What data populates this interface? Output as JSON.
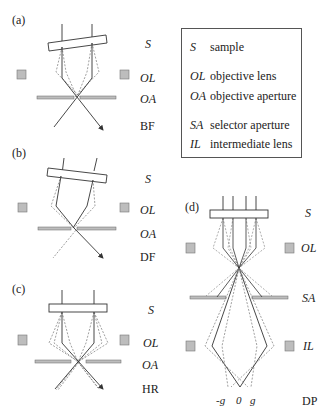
{
  "panels": {
    "a": {
      "tag": "(a)",
      "labels": {
        "S": "S",
        "OL": "OL",
        "OA": "OA",
        "mode": "BF"
      }
    },
    "b": {
      "tag": "(b)",
      "labels": {
        "S": "S",
        "OL": "OL",
        "OA": "OA",
        "mode": "DF"
      }
    },
    "c": {
      "tag": "(c)",
      "labels": {
        "S": "S",
        "OL": "OL",
        "OA": "OA",
        "mode": "HR"
      }
    },
    "d": {
      "tag": "(d)",
      "labels": {
        "S": "S",
        "OL": "OL",
        "SA": "SA",
        "IL": "IL",
        "mode": "DP"
      },
      "spots": {
        "minus_g": "-g",
        "zero": "0",
        "g": "g"
      }
    }
  },
  "legend": {
    "items": [
      {
        "symbol": "S",
        "text": "sample"
      },
      {
        "symbol": "OL",
        "text": "objective lens"
      },
      {
        "symbol": "OA",
        "text": "objective aperture"
      },
      {
        "symbol": "SA",
        "text": "selector aperture"
      },
      {
        "symbol": "IL",
        "text": "intermediate lens"
      }
    ]
  },
  "colors": {
    "line": "#333333",
    "dashed": "#777777",
    "lens_fill": "#bdbdbd",
    "aperture_fill": "#bdbdbd",
    "border": "#555555"
  }
}
